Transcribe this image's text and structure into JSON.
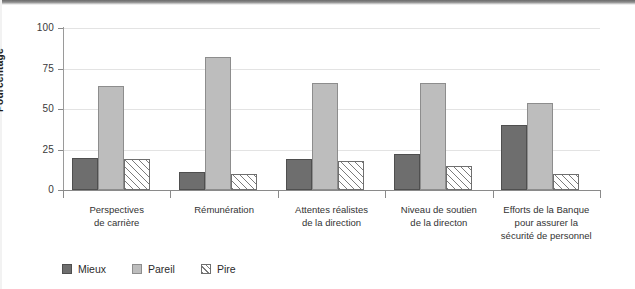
{
  "chart_data": {
    "type": "bar",
    "title": "",
    "xlabel": "",
    "ylabel": "Pourcentage",
    "ylim": [
      0,
      100
    ],
    "yticks": [
      0,
      25,
      50,
      75,
      100
    ],
    "grid": true,
    "legend_position": "bottom-left",
    "categories": [
      "Perspectives\nde carrière",
      "Rémunération",
      "Attentes réalistes\nde la direction",
      "Niveau de soutien\nde la directon",
      "Efforts de la Banque\npour assurer la\nsécurité de personnel"
    ],
    "category_lines": [
      [
        "Perspectives",
        "de carrière"
      ],
      [
        "Rémunération"
      ],
      [
        "Attentes réalistes",
        "de la direction"
      ],
      [
        "Niveau de soutien",
        "de la directon"
      ],
      [
        "Efforts de la Banque",
        "pour assurer la",
        "sécurité de personnel"
      ]
    ],
    "series": [
      {
        "name": "Mieux",
        "color": "#6e6e6e",
        "values": [
          20,
          11,
          19,
          22,
          40
        ]
      },
      {
        "name": "Pareil",
        "color": "#bdbdbd",
        "values": [
          64,
          82,
          66,
          66,
          54
        ]
      },
      {
        "name": "Pire",
        "color": "#ffffff",
        "values": [
          19,
          10,
          18,
          15,
          10
        ]
      }
    ]
  },
  "axis": {
    "y_title": "Pourcentage",
    "tick_labels": [
      "100",
      "75",
      "50",
      "25",
      "0"
    ]
  },
  "legend": {
    "items": [
      {
        "label": "Mieux"
      },
      {
        "label": "Pareil"
      },
      {
        "label": "Pire"
      }
    ]
  }
}
